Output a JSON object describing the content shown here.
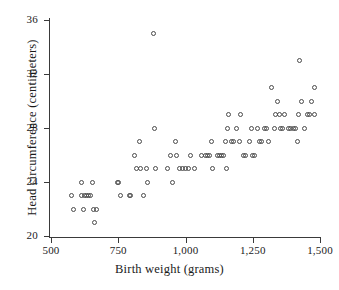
{
  "chart_data": {
    "type": "scatter",
    "title": "",
    "xlabel": "Birth weight (grams)",
    "ylabel": "Head circumference (centimeters)",
    "xlim": [
      500,
      1560
    ],
    "ylim": [
      19.2,
      36.6
    ],
    "xticks": [
      500,
      750,
      1000,
      1250,
      1500
    ],
    "xtick_labels": [
      "500",
      "750",
      "1,000",
      "1,250",
      "1,500"
    ],
    "yticks": [
      20,
      24,
      28,
      32,
      36
    ],
    "ytick_labels": [
      "20",
      "24",
      "28",
      "32",
      "36"
    ],
    "grid": false,
    "legend": null,
    "marker": "open-circle",
    "marker_color": "#4a4a4a",
    "points": [
      [
        578,
        23
      ],
      [
        585,
        22
      ],
      [
        612,
        24
      ],
      [
        613,
        23
      ],
      [
        620,
        22
      ],
      [
        625,
        23
      ],
      [
        633,
        23
      ],
      [
        640,
        23
      ],
      [
        647,
        23
      ],
      [
        655,
        24
      ],
      [
        657,
        22
      ],
      [
        660,
        21
      ],
      [
        668,
        22
      ],
      [
        748,
        24
      ],
      [
        752,
        24
      ],
      [
        760,
        23
      ],
      [
        790,
        23
      ],
      [
        797,
        23
      ],
      [
        812,
        26
      ],
      [
        818,
        25
      ],
      [
        828,
        27
      ],
      [
        832,
        25
      ],
      [
        845,
        23
      ],
      [
        855,
        25
      ],
      [
        860,
        24
      ],
      [
        880,
        35
      ],
      [
        885,
        28
      ],
      [
        890,
        25
      ],
      [
        932,
        25
      ],
      [
        945,
        26
      ],
      [
        952,
        24
      ],
      [
        962,
        27
      ],
      [
        968,
        26
      ],
      [
        978,
        25
      ],
      [
        990,
        25
      ],
      [
        1000,
        25
      ],
      [
        1010,
        25
      ],
      [
        1020,
        26
      ],
      [
        1035,
        25
      ],
      [
        1060,
        26
      ],
      [
        1075,
        26
      ],
      [
        1082,
        26
      ],
      [
        1090,
        26
      ],
      [
        1095,
        27
      ],
      [
        1100,
        25
      ],
      [
        1118,
        26
      ],
      [
        1125,
        26
      ],
      [
        1132,
        26
      ],
      [
        1140,
        26
      ],
      [
        1148,
        27
      ],
      [
        1152,
        25
      ],
      [
        1155,
        28
      ],
      [
        1158,
        29
      ],
      [
        1172,
        27
      ],
      [
        1180,
        27
      ],
      [
        1190,
        28
      ],
      [
        1200,
        27
      ],
      [
        1205,
        29
      ],
      [
        1215,
        26
      ],
      [
        1222,
        26
      ],
      [
        1238,
        27
      ],
      [
        1245,
        28
      ],
      [
        1250,
        26
      ],
      [
        1258,
        26
      ],
      [
        1268,
        28
      ],
      [
        1275,
        27
      ],
      [
        1282,
        27
      ],
      [
        1292,
        28
      ],
      [
        1300,
        28
      ],
      [
        1310,
        27
      ],
      [
        1320,
        31
      ],
      [
        1330,
        28
      ],
      [
        1335,
        29
      ],
      [
        1342,
        30
      ],
      [
        1348,
        29
      ],
      [
        1352,
        28
      ],
      [
        1360,
        28
      ],
      [
        1368,
        29
      ],
      [
        1382,
        28
      ],
      [
        1392,
        28
      ],
      [
        1400,
        28
      ],
      [
        1408,
        28
      ],
      [
        1415,
        27
      ],
      [
        1420,
        29
      ],
      [
        1425,
        33
      ],
      [
        1432,
        30
      ],
      [
        1442,
        28
      ],
      [
        1452,
        29
      ],
      [
        1462,
        29
      ],
      [
        1468,
        30
      ],
      [
        1478,
        31
      ],
      [
        1480,
        29
      ]
    ]
  }
}
